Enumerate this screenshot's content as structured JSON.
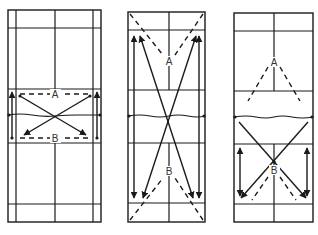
{
  "diagram": {
    "type": "badminton-court-movement-drills",
    "colors": {
      "ink": "#1a1a1a",
      "label": "#333333",
      "background": "#ffffff"
    },
    "courts": [
      {
        "id": "court-1",
        "description": "Net area drill: A and B move diagonally across the net zone, arrows along side lines",
        "labels": {
          "a": "A",
          "b": "B"
        }
      },
      {
        "id": "court-2",
        "description": "Full-court diagonal drill: long crossing arrows from rear corners, dashed lines to A and B",
        "labels": {
          "a": "A",
          "b": "B"
        }
      },
      {
        "id": "court-3",
        "description": "Half-court drill: A dashed lines to front; B crossing arrows in rear half",
        "labels": {
          "a": "A",
          "b": "B"
        }
      }
    ]
  }
}
